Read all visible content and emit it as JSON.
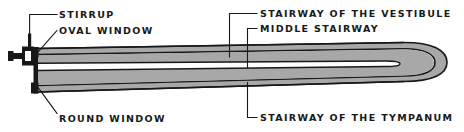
{
  "figure": {
    "kind": "anatomical-diagram",
    "background_color": "#ffffff",
    "ink_color": "#17181a",
    "fluid_fill_color": "#a8a8a8",
    "cavity_color": "#ffffff"
  },
  "labels": {
    "stirrup": "STIRRUP",
    "oval_window": "OVAL WINDOW",
    "stairway_of_the_vestibule": "STAIRWAY OF THE VESTIBULE",
    "middle_stairway": "MIDDLE STAIRWAY",
    "round_window": "ROUND WINDOW",
    "stairway_of_the_tympanum": "STAIRWAY OF THE TYMPANUM"
  },
  "parts": {
    "stirrup_icon": "stirrup-bone",
    "oval_window_icon": "oval-window-membrane",
    "round_window_icon": "round-window-membrane",
    "upper_duct_icon": "scala-vestibuli-duct",
    "middle_duct_icon": "scala-media-duct",
    "lower_duct_icon": "scala-tympani-duct",
    "apex_icon": "cochlear-apex-bend"
  }
}
